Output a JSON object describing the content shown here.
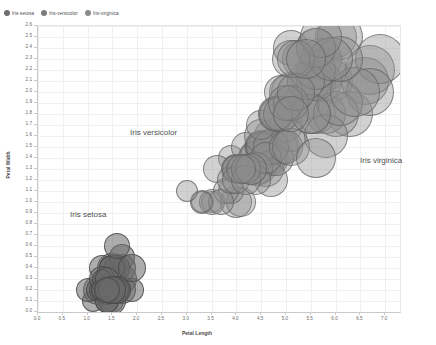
{
  "legend": {
    "items": [
      {
        "label": "Iris-setosa",
        "color": "#6e6e6e",
        "icon": "circle-marker-icon"
      },
      {
        "label": "Iris-versicolor",
        "color": "#7d7d7d",
        "icon": "circle-marker-icon"
      },
      {
        "label": "Iris-virginica",
        "color": "#8a8a8a",
        "icon": "circle-marker-icon"
      }
    ]
  },
  "annotations": [
    {
      "text": "Iris versicolor",
      "x": 130,
      "y": 128
    },
    {
      "text": "Iris virginica",
      "x": 360,
      "y": 156
    },
    {
      "text": "Iris setosa",
      "x": 70,
      "y": 210
    }
  ],
  "axes": {
    "x_ticks": [
      "0.0",
      "0.5",
      "1.0",
      "1.5",
      "2.0",
      "2.5",
      "3.0",
      "3.5",
      "4.0",
      "4.5",
      "5.0",
      "5.5",
      "6.0",
      "6.5",
      "7.0"
    ],
    "y_ticks": [
      "0.0",
      "0.1",
      "0.2",
      "0.3",
      "0.4",
      "0.5",
      "0.6",
      "0.7",
      "0.8",
      "0.9",
      "1.0",
      "1.1",
      "1.2",
      "1.3",
      "1.4",
      "1.5",
      "1.6",
      "1.7",
      "1.8",
      "1.9",
      "2.0",
      "2.1",
      "2.2",
      "2.3",
      "2.4",
      "2.5",
      "2.6"
    ]
  },
  "chart_data": {
    "type": "scatter",
    "title": "",
    "xlabel": "Petal Length",
    "ylabel": "Petal Width",
    "xlim": [
      0.0,
      7.3
    ],
    "ylim": [
      0.0,
      2.6
    ],
    "grid": true,
    "legend_position": "top-left",
    "bubble_note": "marker radius scales with sepal size; markers translucent gray with darker stroke",
    "colors": {
      "setosa_fill": "rgba(105,105,105,0.55)",
      "versicolor_fill": "rgba(140,140,140,0.42)",
      "virginica_fill": "rgba(140,140,140,0.42)",
      "stroke": "rgba(90,90,90,0.75)",
      "grid": "#f0f0f0",
      "axis": "#c9c9c9"
    },
    "series": [
      {
        "name": "Iris-setosa",
        "fill": "rgba(105,105,105,0.55)",
        "stroke": "rgba(70,70,70,0.8)",
        "points": [
          {
            "x": 1.4,
            "y": 0.2,
            "r": 13
          },
          {
            "x": 1.4,
            "y": 0.2,
            "r": 12
          },
          {
            "x": 1.3,
            "y": 0.2,
            "r": 12
          },
          {
            "x": 1.5,
            "y": 0.2,
            "r": 12
          },
          {
            "x": 1.4,
            "y": 0.2,
            "r": 13
          },
          {
            "x": 1.7,
            "y": 0.4,
            "r": 14
          },
          {
            "x": 1.4,
            "y": 0.3,
            "r": 12
          },
          {
            "x": 1.5,
            "y": 0.2,
            "r": 13
          },
          {
            "x": 1.4,
            "y": 0.2,
            "r": 11
          },
          {
            "x": 1.5,
            "y": 0.1,
            "r": 12
          },
          {
            "x": 1.5,
            "y": 0.2,
            "r": 14
          },
          {
            "x": 1.6,
            "y": 0.2,
            "r": 12
          },
          {
            "x": 1.4,
            "y": 0.1,
            "r": 12
          },
          {
            "x": 1.1,
            "y": 0.1,
            "r": 11
          },
          {
            "x": 1.2,
            "y": 0.2,
            "r": 15
          },
          {
            "x": 1.5,
            "y": 0.4,
            "r": 15
          },
          {
            "x": 1.3,
            "y": 0.4,
            "r": 13
          },
          {
            "x": 1.4,
            "y": 0.3,
            "r": 13
          },
          {
            "x": 1.7,
            "y": 0.3,
            "r": 15
          },
          {
            "x": 1.5,
            "y": 0.3,
            "r": 13
          },
          {
            "x": 1.7,
            "y": 0.2,
            "r": 14
          },
          {
            "x": 1.5,
            "y": 0.4,
            "r": 13
          },
          {
            "x": 1.0,
            "y": 0.2,
            "r": 12
          },
          {
            "x": 1.7,
            "y": 0.5,
            "r": 13
          },
          {
            "x": 1.9,
            "y": 0.2,
            "r": 12
          },
          {
            "x": 1.6,
            "y": 0.2,
            "r": 13
          },
          {
            "x": 1.6,
            "y": 0.4,
            "r": 13
          },
          {
            "x": 1.5,
            "y": 0.2,
            "r": 14
          },
          {
            "x": 1.4,
            "y": 0.2,
            "r": 14
          },
          {
            "x": 1.6,
            "y": 0.2,
            "r": 12
          },
          {
            "x": 1.6,
            "y": 0.2,
            "r": 12
          },
          {
            "x": 1.5,
            "y": 0.4,
            "r": 13
          },
          {
            "x": 1.5,
            "y": 0.1,
            "r": 14
          },
          {
            "x": 1.4,
            "y": 0.2,
            "r": 15
          },
          {
            "x": 1.5,
            "y": 0.2,
            "r": 12
          },
          {
            "x": 1.2,
            "y": 0.2,
            "r": 12
          },
          {
            "x": 1.3,
            "y": 0.2,
            "r": 13
          },
          {
            "x": 1.4,
            "y": 0.1,
            "r": 12
          },
          {
            "x": 1.3,
            "y": 0.2,
            "r": 11
          },
          {
            "x": 1.5,
            "y": 0.2,
            "r": 14
          },
          {
            "x": 1.3,
            "y": 0.3,
            "r": 13
          },
          {
            "x": 1.3,
            "y": 0.3,
            "r": 10
          },
          {
            "x": 1.3,
            "y": 0.2,
            "r": 11
          },
          {
            "x": 1.6,
            "y": 0.6,
            "r": 13
          },
          {
            "x": 1.9,
            "y": 0.4,
            "r": 14
          },
          {
            "x": 1.4,
            "y": 0.3,
            "r": 12
          },
          {
            "x": 1.6,
            "y": 0.2,
            "r": 14
          },
          {
            "x": 1.4,
            "y": 0.2,
            "r": 12
          },
          {
            "x": 1.5,
            "y": 0.2,
            "r": 14
          },
          {
            "x": 1.4,
            "y": 0.2,
            "r": 13
          }
        ]
      },
      {
        "name": "Iris-versicolor",
        "fill": "rgba(140,140,140,0.40)",
        "stroke": "rgba(95,95,95,0.70)",
        "points": [
          {
            "x": 4.7,
            "y": 1.4,
            "r": 18
          },
          {
            "x": 4.5,
            "y": 1.5,
            "r": 17
          },
          {
            "x": 4.9,
            "y": 1.5,
            "r": 19
          },
          {
            "x": 4.0,
            "y": 1.3,
            "r": 14
          },
          {
            "x": 4.6,
            "y": 1.5,
            "r": 17
          },
          {
            "x": 4.5,
            "y": 1.3,
            "r": 15
          },
          {
            "x": 4.7,
            "y": 1.6,
            "r": 17
          },
          {
            "x": 3.3,
            "y": 1.0,
            "r": 12
          },
          {
            "x": 4.6,
            "y": 1.3,
            "r": 18
          },
          {
            "x": 3.9,
            "y": 1.4,
            "r": 13
          },
          {
            "x": 3.5,
            "y": 1.0,
            "r": 11
          },
          {
            "x": 4.2,
            "y": 1.5,
            "r": 15
          },
          {
            "x": 4.0,
            "y": 1.0,
            "r": 16
          },
          {
            "x": 4.7,
            "y": 1.4,
            "r": 16
          },
          {
            "x": 3.6,
            "y": 1.3,
            "r": 14
          },
          {
            "x": 4.4,
            "y": 1.4,
            "r": 18
          },
          {
            "x": 4.5,
            "y": 1.5,
            "r": 14
          },
          {
            "x": 4.1,
            "y": 1.0,
            "r": 15
          },
          {
            "x": 4.5,
            "y": 1.5,
            "r": 16
          },
          {
            "x": 3.9,
            "y": 1.1,
            "r": 13
          },
          {
            "x": 4.8,
            "y": 1.8,
            "r": 16
          },
          {
            "x": 4.0,
            "y": 1.3,
            "r": 15
          },
          {
            "x": 4.9,
            "y": 1.5,
            "r": 17
          },
          {
            "x": 4.7,
            "y": 1.2,
            "r": 17
          },
          {
            "x": 4.3,
            "y": 1.3,
            "r": 16
          },
          {
            "x": 4.4,
            "y": 1.4,
            "r": 17
          },
          {
            "x": 4.8,
            "y": 1.4,
            "r": 18
          },
          {
            "x": 5.0,
            "y": 1.7,
            "r": 17
          },
          {
            "x": 4.5,
            "y": 1.5,
            "r": 16
          },
          {
            "x": 3.5,
            "y": 1.0,
            "r": 13
          },
          {
            "x": 3.8,
            "y": 1.1,
            "r": 13
          },
          {
            "x": 3.7,
            "y": 1.0,
            "r": 13
          },
          {
            "x": 3.9,
            "y": 1.2,
            "r": 14
          },
          {
            "x": 5.1,
            "y": 1.6,
            "r": 16
          },
          {
            "x": 4.5,
            "y": 1.5,
            "r": 15
          },
          {
            "x": 4.5,
            "y": 1.6,
            "r": 17
          },
          {
            "x": 4.7,
            "y": 1.5,
            "r": 18
          },
          {
            "x": 4.4,
            "y": 1.3,
            "r": 17
          },
          {
            "x": 4.1,
            "y": 1.3,
            "r": 14
          },
          {
            "x": 4.0,
            "y": 1.3,
            "r": 14
          },
          {
            "x": 4.4,
            "y": 1.2,
            "r": 15
          },
          {
            "x": 4.6,
            "y": 1.4,
            "r": 16
          },
          {
            "x": 4.0,
            "y": 1.2,
            "r": 14
          },
          {
            "x": 3.3,
            "y": 1.0,
            "r": 11
          },
          {
            "x": 4.2,
            "y": 1.3,
            "r": 15
          },
          {
            "x": 4.2,
            "y": 1.2,
            "r": 15
          },
          {
            "x": 4.2,
            "y": 1.3,
            "r": 15
          },
          {
            "x": 4.3,
            "y": 1.3,
            "r": 16
          },
          {
            "x": 3.0,
            "y": 1.1,
            "r": 11
          },
          {
            "x": 4.1,
            "y": 1.3,
            "r": 15
          }
        ]
      },
      {
        "name": "Iris-virginica",
        "fill": "rgba(140,140,140,0.40)",
        "stroke": "rgba(95,95,95,0.70)",
        "points": [
          {
            "x": 6.0,
            "y": 2.5,
            "r": 21
          },
          {
            "x": 5.1,
            "y": 1.9,
            "r": 18
          },
          {
            "x": 5.9,
            "y": 2.1,
            "r": 22
          },
          {
            "x": 5.6,
            "y": 1.8,
            "r": 20
          },
          {
            "x": 5.8,
            "y": 2.2,
            "r": 21
          },
          {
            "x": 6.6,
            "y": 2.1,
            "r": 24
          },
          {
            "x": 4.5,
            "y": 1.7,
            "r": 15
          },
          {
            "x": 6.3,
            "y": 1.8,
            "r": 23
          },
          {
            "x": 5.8,
            "y": 1.8,
            "r": 20
          },
          {
            "x": 6.1,
            "y": 2.5,
            "r": 23
          },
          {
            "x": 5.1,
            "y": 2.0,
            "r": 20
          },
          {
            "x": 5.3,
            "y": 1.9,
            "r": 19
          },
          {
            "x": 5.5,
            "y": 2.1,
            "r": 20
          },
          {
            "x": 5.0,
            "y": 2.0,
            "r": 17
          },
          {
            "x": 5.1,
            "y": 2.4,
            "r": 18
          },
          {
            "x": 5.3,
            "y": 2.3,
            "r": 19
          },
          {
            "x": 5.5,
            "y": 1.8,
            "r": 20
          },
          {
            "x": 6.7,
            "y": 2.2,
            "r": 25
          },
          {
            "x": 6.9,
            "y": 2.3,
            "r": 25
          },
          {
            "x": 5.0,
            "y": 1.5,
            "r": 17
          },
          {
            "x": 5.7,
            "y": 2.3,
            "r": 21
          },
          {
            "x": 4.9,
            "y": 2.0,
            "r": 17
          },
          {
            "x": 6.7,
            "y": 2.0,
            "r": 24
          },
          {
            "x": 4.9,
            "y": 1.8,
            "r": 18
          },
          {
            "x": 5.7,
            "y": 2.1,
            "r": 21
          },
          {
            "x": 6.0,
            "y": 1.8,
            "r": 23
          },
          {
            "x": 4.8,
            "y": 1.8,
            "r": 18
          },
          {
            "x": 4.9,
            "y": 1.8,
            "r": 18
          },
          {
            "x": 5.6,
            "y": 2.1,
            "r": 20
          },
          {
            "x": 5.8,
            "y": 1.6,
            "r": 22
          },
          {
            "x": 6.1,
            "y": 1.9,
            "r": 23
          },
          {
            "x": 6.4,
            "y": 2.0,
            "r": 25
          },
          {
            "x": 5.6,
            "y": 2.2,
            "r": 20
          },
          {
            "x": 5.1,
            "y": 1.5,
            "r": 19
          },
          {
            "x": 5.6,
            "y": 1.4,
            "r": 20
          },
          {
            "x": 6.1,
            "y": 2.3,
            "r": 23
          },
          {
            "x": 5.6,
            "y": 2.4,
            "r": 20
          },
          {
            "x": 5.5,
            "y": 1.8,
            "r": 20
          },
          {
            "x": 4.8,
            "y": 1.8,
            "r": 17
          },
          {
            "x": 5.4,
            "y": 2.1,
            "r": 19
          },
          {
            "x": 5.6,
            "y": 2.4,
            "r": 20
          },
          {
            "x": 5.1,
            "y": 2.3,
            "r": 19
          },
          {
            "x": 5.1,
            "y": 1.9,
            "r": 18
          },
          {
            "x": 5.9,
            "y": 2.3,
            "r": 22
          },
          {
            "x": 5.7,
            "y": 2.5,
            "r": 21
          },
          {
            "x": 5.2,
            "y": 2.3,
            "r": 19
          },
          {
            "x": 5.0,
            "y": 1.9,
            "r": 18
          },
          {
            "x": 5.2,
            "y": 2.0,
            "r": 19
          },
          {
            "x": 5.4,
            "y": 2.3,
            "r": 20
          },
          {
            "x": 5.1,
            "y": 1.8,
            "r": 18
          }
        ]
      }
    ]
  }
}
